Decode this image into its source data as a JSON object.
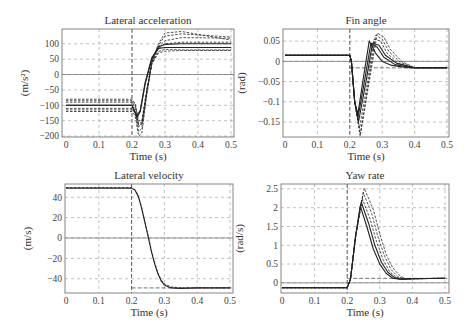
{
  "chart_data": [
    {
      "id": "lat_acc",
      "type": "line",
      "title": "Lateral acceleration",
      "xlabel": "Time (s)",
      "ylabel": "(m/s²)",
      "xlim": [
        0,
        0.5
      ],
      "ylim": [
        -203,
        148
      ],
      "xticks": [
        0,
        0.1,
        0.2,
        0.3,
        0.4,
        0.5
      ],
      "xtick_labels": [
        "0",
        "0.1",
        "0.2",
        "0.3",
        "0.4",
        "0.5"
      ],
      "yticks": [
        100,
        50,
        0,
        -50,
        -100,
        -150,
        -200
      ],
      "ytick_labels": [
        "100",
        "50",
        "0",
        "−50",
        "−100",
        "−150",
        "−200"
      ],
      "grid": true,
      "zero_line": true,
      "vline": 0.2,
      "box": {
        "x0": 62,
        "x1": 234,
        "y0": 29,
        "y1": 137,
        "px0": 66,
        "px1": 231
      },
      "series": [
        {
          "name": "nominal",
          "style": "solid",
          "x": [
            0,
            0.2,
            0.205,
            0.215,
            0.225,
            0.24,
            0.26,
            0.28,
            0.3,
            0.35,
            0.5
          ],
          "y": [
            -100,
            -100,
            -110,
            -140,
            -120,
            -30,
            50,
            90,
            98,
            100,
            100
          ]
        },
        {
          "name": "nominal-2",
          "style": "solid",
          "x": [
            0,
            0.2,
            0.205,
            0.215,
            0.225,
            0.24,
            0.26,
            0.28,
            0.3,
            0.35,
            0.5
          ],
          "y": [
            -100,
            -100,
            -112,
            -135,
            -115,
            -25,
            55,
            85,
            88,
            88,
            88
          ]
        },
        {
          "name": "var1",
          "style": "dashed",
          "x": [
            0,
            0.2,
            0.21,
            0.22,
            0.23,
            0.245,
            0.26,
            0.28,
            0.3,
            0.35,
            0.5
          ],
          "y": [
            -80,
            -80,
            -95,
            -150,
            -150,
            -50,
            40,
            90,
            110,
            120,
            118
          ]
        },
        {
          "name": "var2",
          "style": "dashed",
          "x": [
            0,
            0.2,
            0.21,
            0.22,
            0.23,
            0.245,
            0.26,
            0.28,
            0.3,
            0.35,
            0.5
          ],
          "y": [
            -90,
            -90,
            -110,
            -165,
            -160,
            -55,
            40,
            95,
            125,
            132,
            122
          ]
        },
        {
          "name": "var3",
          "style": "dashed",
          "x": [
            0,
            0.2,
            0.21,
            0.22,
            0.23,
            0.245,
            0.26,
            0.28,
            0.3,
            0.35,
            0.5
          ],
          "y": [
            -110,
            -110,
            -125,
            -185,
            -175,
            -60,
            40,
            100,
            135,
            140,
            112
          ]
        },
        {
          "name": "var4",
          "style": "dashed",
          "x": [
            0,
            0.2,
            0.21,
            0.22,
            0.23,
            0.245,
            0.26,
            0.28,
            0.3,
            0.35,
            0.5
          ],
          "y": [
            -120,
            -120,
            -135,
            -200,
            -190,
            -65,
            35,
            85,
            100,
            105,
            105
          ]
        },
        {
          "name": "var5",
          "style": "dashed",
          "x": [
            0,
            0.2,
            0.21,
            0.22,
            0.23,
            0.245,
            0.26,
            0.28,
            0.3,
            0.35,
            0.5
          ],
          "y": [
            -115,
            -115,
            -125,
            -170,
            -160,
            -55,
            35,
            75,
            82,
            80,
            80
          ]
        },
        {
          "name": "var6",
          "style": "dashed",
          "x": [
            0,
            0.2,
            0.21,
            0.22,
            0.23,
            0.245,
            0.26,
            0.28,
            0.3,
            0.35,
            0.5
          ],
          "y": [
            -85,
            -85,
            -100,
            -160,
            -155,
            -50,
            35,
            70,
            76,
            78,
            78
          ]
        }
      ]
    },
    {
      "id": "fin_angle",
      "type": "line",
      "title": "Fin angle",
      "xlabel": "Time (s)",
      "ylabel": "(rad)",
      "xlim": [
        0,
        0.5
      ],
      "ylim": [
        -0.187,
        0.08
      ],
      "xticks": [
        0,
        0.1,
        0.2,
        0.3,
        0.4,
        0.5
      ],
      "xtick_labels": [
        "0",
        "0.1",
        "0.2",
        "0.3",
        "0.4",
        "0.5"
      ],
      "yticks": [
        0.05,
        0,
        -0.05,
        -0.1,
        -0.15
      ],
      "ytick_labels": [
        "0.05",
        "0",
        "−0.05",
        "−0.1",
        "−0.15"
      ],
      "grid": true,
      "zero_line": true,
      "hline": -0.016,
      "vline": 0.2,
      "box": {
        "x0": 283,
        "x1": 449,
        "y0": 29,
        "y1": 137,
        "px0": 285,
        "px1": 447
      },
      "series": [
        {
          "name": "nominal",
          "style": "solid",
          "x": [
            0,
            0.2,
            0.205,
            0.215,
            0.225,
            0.24,
            0.26,
            0.28,
            0.3,
            0.33,
            0.38,
            0.5
          ],
          "y": [
            0.015,
            0.015,
            0.0,
            -0.1,
            -0.13,
            -0.05,
            0.05,
            0.02,
            0.0,
            -0.01,
            -0.016,
            -0.016
          ]
        },
        {
          "name": "s2",
          "style": "solid",
          "x": [
            0,
            0.2,
            0.205,
            0.215,
            0.225,
            0.245,
            0.265,
            0.285,
            0.305,
            0.34,
            0.39,
            0.5
          ],
          "y": [
            0.015,
            0.015,
            0.0,
            -0.1,
            -0.14,
            -0.05,
            0.045,
            0.035,
            0.01,
            -0.008,
            -0.016,
            -0.016
          ]
        },
        {
          "name": "s3",
          "style": "solid",
          "x": [
            0,
            0.2,
            0.205,
            0.215,
            0.227,
            0.25,
            0.27,
            0.29,
            0.31,
            0.345,
            0.4,
            0.5
          ],
          "y": [
            0.015,
            0.015,
            0.0,
            -0.1,
            -0.15,
            -0.05,
            0.045,
            0.04,
            0.015,
            -0.005,
            -0.016,
            -0.016
          ]
        },
        {
          "name": "s4",
          "style": "dashed",
          "x": [
            0,
            0.2,
            0.205,
            0.215,
            0.23,
            0.255,
            0.275,
            0.295,
            0.315,
            0.35,
            0.4,
            0.5
          ],
          "y": [
            0.015,
            0.015,
            0.0,
            -0.1,
            -0.165,
            -0.05,
            0.055,
            0.05,
            0.02,
            -0.005,
            -0.016,
            -0.016
          ]
        },
        {
          "name": "s5",
          "style": "dashed",
          "x": [
            0,
            0.2,
            0.205,
            0.215,
            0.232,
            0.258,
            0.28,
            0.3,
            0.32,
            0.355,
            0.4,
            0.5
          ],
          "y": [
            0.015,
            0.015,
            0.0,
            -0.1,
            -0.18,
            -0.05,
            0.065,
            0.055,
            0.025,
            -0.002,
            -0.016,
            -0.016
          ]
        },
        {
          "name": "s6",
          "style": "dashed",
          "x": [
            0,
            0.2,
            0.205,
            0.215,
            0.232,
            0.26,
            0.285,
            0.305,
            0.325,
            0.36,
            0.4,
            0.5
          ],
          "y": [
            0.015,
            0.015,
            0.0,
            -0.1,
            -0.185,
            -0.05,
            0.07,
            0.06,
            0.03,
            0.0,
            -0.016,
            -0.016
          ]
        }
      ]
    },
    {
      "id": "lat_vel",
      "type": "line",
      "title": "Lateral velocity",
      "xlabel": "Time (s)",
      "ylabel": "(m/s)",
      "xlim": [
        0,
        0.5
      ],
      "ylim": [
        -54,
        53
      ],
      "xticks": [
        0,
        0.1,
        0.2,
        0.3,
        0.4,
        0.5
      ],
      "xtick_labels": [
        "0",
        "0.1",
        "0.2",
        "0.3",
        "0.4",
        "0.5"
      ],
      "yticks": [
        40,
        20,
        0,
        -20,
        -40
      ],
      "ytick_labels": [
        "40",
        "20",
        "0",
        "−20",
        "−40"
      ],
      "grid": true,
      "zero_line": true,
      "hline": -49,
      "vline": 0.2,
      "box": {
        "x0": 65,
        "x1": 233,
        "y0": 184,
        "y1": 293,
        "px0": 66,
        "px1": 230
      },
      "series": [
        {
          "name": "nominal",
          "style": "solid",
          "x": [
            0,
            0.2,
            0.21,
            0.22,
            0.23,
            0.24,
            0.25,
            0.26,
            0.27,
            0.28,
            0.29,
            0.3,
            0.32,
            0.35,
            0.4,
            0.5
          ],
          "y": [
            49,
            49,
            47,
            41,
            30,
            16,
            2,
            -13,
            -25,
            -35,
            -42,
            -46,
            -49,
            -49.5,
            -49,
            -49
          ]
        },
        {
          "name": "var",
          "style": "dashed",
          "x": [
            0,
            0.2,
            0.21,
            0.22,
            0.23,
            0.24,
            0.25,
            0.26,
            0.27,
            0.28,
            0.29,
            0.3,
            0.32,
            0.35,
            0.4,
            0.5
          ],
          "y": [
            49.5,
            49.5,
            47.5,
            42,
            31,
            17,
            3,
            -12,
            -24,
            -34,
            -41,
            -45,
            -48,
            -49,
            -49,
            -49
          ]
        }
      ]
    },
    {
      "id": "yaw_rate",
      "type": "line",
      "title": "Yaw rate",
      "xlabel": "Time (s)",
      "ylabel": "(rad/s)",
      "xlim": [
        0,
        0.5
      ],
      "ylim": [
        -0.27,
        2.63
      ],
      "xticks": [
        0,
        0.1,
        0.2,
        0.3,
        0.4,
        0.5
      ],
      "xtick_labels": [
        "0",
        "0.1",
        "0.2",
        "0.3",
        "0.4",
        "0.5"
      ],
      "yticks": [
        2.5,
        2,
        1.5,
        1,
        0.5,
        0
      ],
      "ytick_labels": [
        "2.5",
        "2",
        "1.5",
        "1",
        "0.5",
        "0"
      ],
      "grid": true,
      "zero_line": true,
      "hline": 0.12,
      "vline": 0.2,
      "box": {
        "x0": 281,
        "x1": 449,
        "y0": 184,
        "y1": 293,
        "px0": 282,
        "px1": 445
      },
      "series": [
        {
          "name": "nominal",
          "style": "solid",
          "x": [
            0,
            0.2,
            0.21,
            0.225,
            0.24,
            0.26,
            0.28,
            0.3,
            0.32,
            0.34,
            0.36,
            0.4,
            0.5
          ],
          "y": [
            -0.13,
            -0.13,
            0.1,
            1.2,
            2.05,
            1.5,
            0.9,
            0.5,
            0.25,
            0.12,
            0.1,
            0.11,
            0.12
          ]
        },
        {
          "name": "s2",
          "style": "solid",
          "x": [
            0,
            0.2,
            0.21,
            0.225,
            0.243,
            0.265,
            0.285,
            0.305,
            0.325,
            0.345,
            0.365,
            0.4,
            0.5
          ],
          "y": [
            -0.13,
            -0.13,
            0.1,
            1.2,
            2.15,
            1.6,
            1.0,
            0.55,
            0.28,
            0.14,
            0.1,
            0.11,
            0.12
          ]
        },
        {
          "name": "s3",
          "style": "dashed",
          "x": [
            0,
            0.2,
            0.21,
            0.225,
            0.246,
            0.27,
            0.29,
            0.31,
            0.33,
            0.35,
            0.37,
            0.4,
            0.5
          ],
          "y": [
            -0.13,
            -0.13,
            0.1,
            1.2,
            2.25,
            1.7,
            1.1,
            0.62,
            0.3,
            0.15,
            0.1,
            0.11,
            0.12
          ]
        },
        {
          "name": "s4",
          "style": "dashed",
          "x": [
            0,
            0.2,
            0.21,
            0.225,
            0.249,
            0.275,
            0.295,
            0.315,
            0.335,
            0.355,
            0.375,
            0.4,
            0.5
          ],
          "y": [
            -0.13,
            -0.13,
            0.1,
            1.2,
            2.4,
            1.85,
            1.2,
            0.7,
            0.35,
            0.17,
            0.1,
            0.11,
            0.12
          ]
        },
        {
          "name": "s5",
          "style": "dashed",
          "x": [
            0,
            0.2,
            0.21,
            0.225,
            0.252,
            0.28,
            0.3,
            0.32,
            0.34,
            0.36,
            0.38,
            0.41,
            0.5
          ],
          "y": [
            -0.13,
            -0.13,
            0.1,
            1.2,
            2.52,
            1.95,
            1.3,
            0.75,
            0.4,
            0.2,
            0.1,
            0.11,
            0.12
          ]
        }
      ]
    }
  ]
}
